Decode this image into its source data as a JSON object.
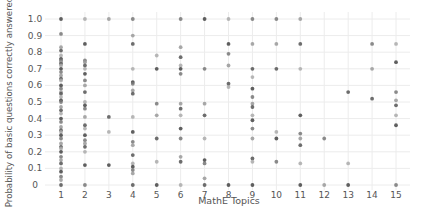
{
  "chart_data": {
    "type": "scatter",
    "title": "",
    "xlabel": "MathE Topics",
    "ylabel": "Probability of basic questions correctly answered",
    "x_ticks": [
      1,
      2,
      3,
      4,
      5,
      6,
      7,
      8,
      9,
      10,
      11,
      12,
      13,
      14,
      15
    ],
    "y_ticks": [
      0,
      0.1,
      0.2,
      0.3,
      0.4,
      0.5,
      0.6,
      0.7,
      0.8,
      0.9,
      1.0
    ],
    "y_tick_labels": [
      "0",
      "0.1",
      "0.2",
      "0.3",
      "0.4",
      "0.5",
      "0.6",
      "0.7",
      "0.8",
      "0.9",
      "1.0"
    ],
    "xlim": [
      0.6,
      15.4
    ],
    "ylim": [
      -0.02,
      1.03
    ],
    "grid": true,
    "legend": "none",
    "note": "Values are approximate readings of marker positions; overlapping markers may represent multiple observations.",
    "series": [
      {
        "name": "topic_points",
        "points": [
          [
            1,
            1.0
          ],
          [
            1,
            0.91
          ],
          [
            1,
            0.83
          ],
          [
            1,
            0.81
          ],
          [
            1,
            0.78
          ],
          [
            1,
            0.76
          ],
          [
            1,
            0.75
          ],
          [
            1,
            0.74
          ],
          [
            1,
            0.73
          ],
          [
            1,
            0.72
          ],
          [
            1,
            0.7
          ],
          [
            1,
            0.68
          ],
          [
            1,
            0.66
          ],
          [
            1,
            0.64
          ],
          [
            1,
            0.63
          ],
          [
            1,
            0.6
          ],
          [
            1,
            0.58
          ],
          [
            1,
            0.56
          ],
          [
            1,
            0.55
          ],
          [
            1,
            0.53
          ],
          [
            1,
            0.51
          ],
          [
            1,
            0.5
          ],
          [
            1,
            0.47
          ],
          [
            1,
            0.45
          ],
          [
            1,
            0.43
          ],
          [
            1,
            0.4
          ],
          [
            1,
            0.38
          ],
          [
            1,
            0.35
          ],
          [
            1,
            0.33
          ],
          [
            1,
            0.32
          ],
          [
            1,
            0.3
          ],
          [
            1,
            0.28
          ],
          [
            1,
            0.25
          ],
          [
            1,
            0.23
          ],
          [
            1,
            0.22
          ],
          [
            1,
            0.2
          ],
          [
            1,
            0.17
          ],
          [
            1,
            0.15
          ],
          [
            1,
            0.13
          ],
          [
            1,
            0.1
          ],
          [
            1,
            0.08
          ],
          [
            1,
            0.05
          ],
          [
            1,
            0.03
          ],
          [
            1,
            0.0
          ],
          [
            2,
            1.0
          ],
          [
            2,
            0.85
          ],
          [
            2,
            0.75
          ],
          [
            2,
            0.74
          ],
          [
            2,
            0.72
          ],
          [
            2,
            0.7
          ],
          [
            2,
            0.67
          ],
          [
            2,
            0.63
          ],
          [
            2,
            0.6
          ],
          [
            2,
            0.56
          ],
          [
            2,
            0.5
          ],
          [
            2,
            0.48
          ],
          [
            2,
            0.46
          ],
          [
            2,
            0.41
          ],
          [
            2,
            0.36
          ],
          [
            2,
            0.34
          ],
          [
            2,
            0.3
          ],
          [
            2,
            0.27
          ],
          [
            2,
            0.25
          ],
          [
            2,
            0.23
          ],
          [
            2,
            0.2
          ],
          [
            2,
            0.12
          ],
          [
            2,
            0.0
          ],
          [
            3,
            1.0
          ],
          [
            3,
            0.41
          ],
          [
            3,
            0.32
          ],
          [
            3,
            0.12
          ],
          [
            4,
            1.0
          ],
          [
            4,
            0.9
          ],
          [
            4,
            0.85
          ],
          [
            4,
            0.7
          ],
          [
            4,
            0.62
          ],
          [
            4,
            0.61
          ],
          [
            4,
            0.57
          ],
          [
            4,
            0.55
          ],
          [
            4,
            0.41
          ],
          [
            4,
            0.32
          ],
          [
            4,
            0.26
          ],
          [
            4,
            0.24
          ],
          [
            4,
            0.18
          ],
          [
            4,
            0.13
          ],
          [
            4,
            0.11
          ],
          [
            4,
            0.09
          ],
          [
            4,
            0.07
          ],
          [
            4,
            0.0
          ],
          [
            5,
            0.78
          ],
          [
            5,
            0.7
          ],
          [
            5,
            0.49
          ],
          [
            5,
            0.42
          ],
          [
            5,
            0.28
          ],
          [
            5,
            0.14
          ],
          [
            5,
            0.0
          ],
          [
            6,
            1.0
          ],
          [
            6,
            0.83
          ],
          [
            6,
            0.77
          ],
          [
            6,
            0.72
          ],
          [
            6,
            0.7
          ],
          [
            6,
            0.67
          ],
          [
            6,
            0.49
          ],
          [
            6,
            0.46
          ],
          [
            6,
            0.42
          ],
          [
            6,
            0.34
          ],
          [
            6,
            0.28
          ],
          [
            6,
            0.17
          ],
          [
            6,
            0.14
          ],
          [
            6,
            0.0
          ],
          [
            7,
            1.0
          ],
          [
            7,
            0.7
          ],
          [
            7,
            0.49
          ],
          [
            7,
            0.42
          ],
          [
            7,
            0.28
          ],
          [
            7,
            0.15
          ],
          [
            7,
            0.13
          ],
          [
            7,
            0.04
          ],
          [
            7,
            0.0
          ],
          [
            8,
            1.0
          ],
          [
            8,
            0.85
          ],
          [
            8,
            0.79
          ],
          [
            8,
            0.72
          ],
          [
            8,
            0.61
          ],
          [
            8,
            0.59
          ],
          [
            8,
            0.0
          ],
          [
            9,
            1.0
          ],
          [
            9,
            0.85
          ],
          [
            9,
            0.7
          ],
          [
            9,
            0.65
          ],
          [
            9,
            0.58
          ],
          [
            9,
            0.53
          ],
          [
            9,
            0.49
          ],
          [
            9,
            0.47
          ],
          [
            9,
            0.42
          ],
          [
            9,
            0.39
          ],
          [
            9,
            0.34
          ],
          [
            9,
            0.28
          ],
          [
            9,
            0.16
          ],
          [
            9,
            0.14
          ],
          [
            9,
            0.0
          ],
          [
            10,
            1.0
          ],
          [
            10,
            0.85
          ],
          [
            10,
            0.7
          ],
          [
            10,
            0.32
          ],
          [
            10,
            0.28
          ],
          [
            10,
            0.14
          ],
          [
            11,
            1.0
          ],
          [
            11,
            0.85
          ],
          [
            11,
            0.7
          ],
          [
            11,
            0.42
          ],
          [
            11,
            0.31
          ],
          [
            11,
            0.28
          ],
          [
            11,
            0.24
          ],
          [
            11,
            0.13
          ],
          [
            11,
            0.0
          ],
          [
            12,
            0.28
          ],
          [
            12,
            0.0
          ],
          [
            13,
            0.56
          ],
          [
            13,
            0.13
          ],
          [
            13,
            0.0
          ],
          [
            14,
            0.85
          ],
          [
            14,
            0.7
          ],
          [
            14,
            0.52
          ],
          [
            15,
            0.85
          ],
          [
            15,
            0.74
          ],
          [
            15,
            0.56
          ],
          [
            15,
            0.51
          ],
          [
            15,
            0.48
          ],
          [
            15,
            0.42
          ],
          [
            15,
            0.36
          ],
          [
            15,
            0.0
          ]
        ]
      }
    ]
  }
}
